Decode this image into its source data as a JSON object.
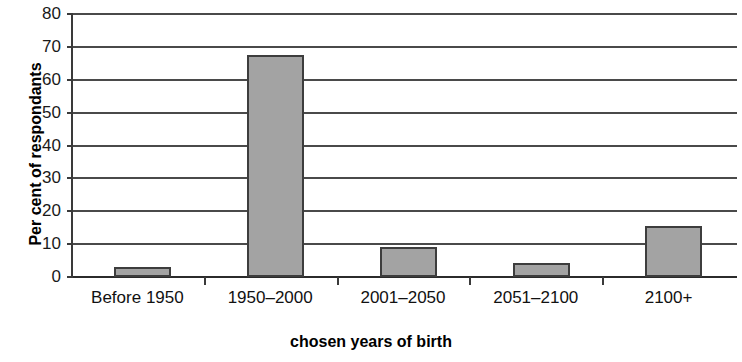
{
  "chart_data": {
    "type": "bar",
    "title": "",
    "xlabel": "chosen years of birth",
    "ylabel": "Per cent of respondants",
    "categories": [
      "Before 1950",
      "1950–2000",
      "2001–2050",
      "2051–2100",
      "2100+"
    ],
    "values": [
      3,
      67.5,
      9,
      4.3,
      15.5
    ],
    "ylim": [
      0,
      80
    ],
    "ytick_labels": [
      "80",
      "70",
      "60",
      "50",
      "40",
      "30",
      "20",
      "10",
      "0"
    ],
    "ytick_values": [
      80,
      70,
      60,
      50,
      40,
      30,
      20,
      10,
      0
    ],
    "ytick_step": 10,
    "grid": "horizontal",
    "legend": "none",
    "bar_fill_color": "#a3a3a3",
    "bar_border_color": "#3d3d3d",
    "axis_color": "#3a3a3a",
    "background_color": "#ffffff"
  }
}
